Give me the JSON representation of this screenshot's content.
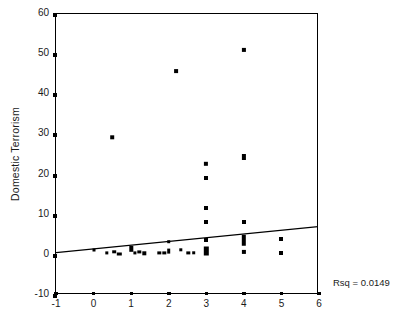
{
  "chart": {
    "y_axis_title": "Domestic Terrorism",
    "annotation": "Rsq = 0.0149",
    "x_tick_labels": [
      "-1",
      "0",
      "1",
      "2",
      "3",
      "4",
      "5",
      "6"
    ],
    "y_tick_labels": [
      "-10",
      "0",
      "10",
      "20",
      "30",
      "40",
      "50",
      "60"
    ],
    "marker_color": "#000000",
    "line_color": "#000000",
    "axis_color": "#000000"
  },
  "chart_data": {
    "type": "scatter",
    "title": "",
    "xlabel": "",
    "ylabel": "Domestic Terrorism",
    "xlim": [
      -1,
      6
    ],
    "ylim": [
      -10,
      60
    ],
    "xticks": [
      -1,
      0,
      1,
      2,
      3,
      4,
      5,
      6
    ],
    "yticks": [
      -10,
      0,
      10,
      20,
      30,
      40,
      50,
      60
    ],
    "grid": false,
    "legend": "none",
    "annotations": [
      {
        "text": "Rsq = 0.0149",
        "x": 6.6,
        "y": -9.5
      }
    ],
    "fit_line": {
      "type": "linear",
      "x_start": -1,
      "y_start": 0.3,
      "x_end": 6,
      "y_end": 6.8,
      "slope": 0.93,
      "intercept": 1.23,
      "r_squared": 0.0149
    },
    "points": [
      {
        "x": 0.0,
        "y": 1.0,
        "w": 3.0,
        "h": 3.0
      },
      {
        "x": 0.35,
        "y": 0.2,
        "w": 3.4,
        "h": 3.2
      },
      {
        "x": 0.5,
        "y": 29.0,
        "w": 3.6,
        "h": 3.4
      },
      {
        "x": 0.55,
        "y": 0.5,
        "w": 3.6,
        "h": 3.4
      },
      {
        "x": 0.68,
        "y": 0.0,
        "w": 4.4,
        "h": 3.0
      },
      {
        "x": 1.0,
        "y": 1.2,
        "w": 3.4,
        "h": 6.4
      },
      {
        "x": 1.1,
        "y": 0.2,
        "w": 3.2,
        "h": 3.2
      },
      {
        "x": 1.22,
        "y": 0.4,
        "w": 3.4,
        "h": 3.2
      },
      {
        "x": 1.35,
        "y": 0.1,
        "w": 3.4,
        "h": 3.4
      },
      {
        "x": 1.75,
        "y": 0.2,
        "w": 3.4,
        "h": 3.2
      },
      {
        "x": 1.88,
        "y": 0.2,
        "w": 3.4,
        "h": 3.2
      },
      {
        "x": 2.0,
        "y": 0.6,
        "w": 3.6,
        "h": 4.8
      },
      {
        "x": 2.0,
        "y": 3.0,
        "w": 3.6,
        "h": 3.6
      },
      {
        "x": 2.2,
        "y": 45.5,
        "w": 3.8,
        "h": 3.8
      },
      {
        "x": 2.32,
        "y": 1.0,
        "w": 3.4,
        "h": 3.4
      },
      {
        "x": 2.52,
        "y": 0.2,
        "w": 3.4,
        "h": 3.2
      },
      {
        "x": 2.66,
        "y": 0.3,
        "w": 3.6,
        "h": 3.4
      },
      {
        "x": 3.0,
        "y": 22.4,
        "w": 4.2,
        "h": 4.4
      },
      {
        "x": 3.0,
        "y": 19.0,
        "w": 4.0,
        "h": 4.0
      },
      {
        "x": 3.0,
        "y": 11.4,
        "w": 4.0,
        "h": 4.0
      },
      {
        "x": 3.0,
        "y": 8.0,
        "w": 4.0,
        "h": 4.0
      },
      {
        "x": 3.0,
        "y": 3.4,
        "w": 4.0,
        "h": 4.0
      },
      {
        "x": 3.0,
        "y": 0.8,
        "w": 4.4,
        "h": 9.0
      },
      {
        "x": 4.0,
        "y": 50.8,
        "w": 4.2,
        "h": 4.2
      },
      {
        "x": 4.0,
        "y": 24.2,
        "w": 4.2,
        "h": 6.0
      },
      {
        "x": 4.0,
        "y": 8.0,
        "w": 4.0,
        "h": 4.0
      },
      {
        "x": 4.0,
        "y": 3.4,
        "w": 4.4,
        "h": 10.5
      },
      {
        "x": 4.0,
        "y": 0.4,
        "w": 4.2,
        "h": 4.2
      },
      {
        "x": 5.0,
        "y": 3.6,
        "w": 4.0,
        "h": 4.0
      },
      {
        "x": 5.0,
        "y": 0.3,
        "w": 4.0,
        "h": 4.0
      }
    ]
  }
}
